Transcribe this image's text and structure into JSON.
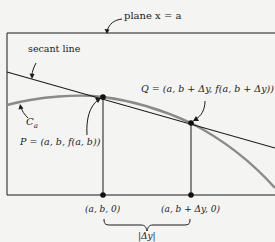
{
  "diagram": {
    "labels": {
      "plane": "plane x = a",
      "secant": "secant line",
      "curve": "C",
      "curve_sub": "a",
      "point_p": "P = (a, b, f(a, b))",
      "point_q": "Q = (a, b + Δy, f(a, b + Δy))",
      "base_p": "(a, b, 0)",
      "base_q": "(a, b + Δy, 0)",
      "delta": "|Δy|"
    },
    "colors": {
      "background": "#f4f4f2",
      "line": "#1a1a1a",
      "curve": "#8a8a8a",
      "text": "#222222"
    }
  }
}
